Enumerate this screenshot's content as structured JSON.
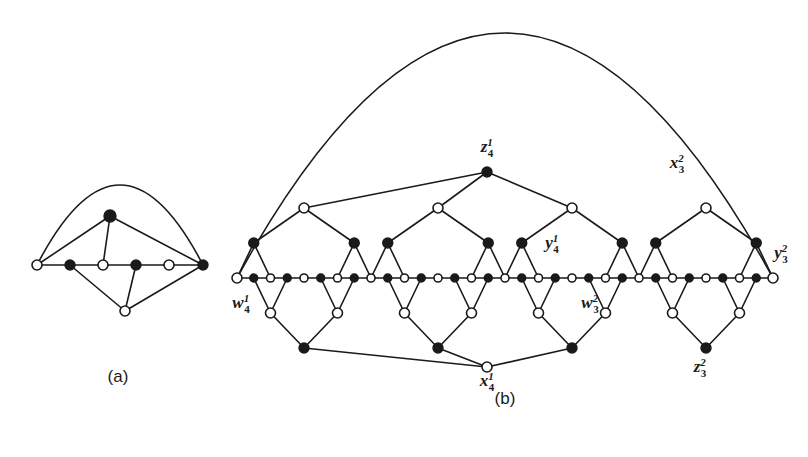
{
  "figure": {
    "background_color": "#ffffff",
    "ink_color": "#1a1a1a",
    "width": 808,
    "height": 457
  },
  "panels": [
    {
      "id": "panel-a",
      "caption": "(a)",
      "caption_x": 118,
      "caption_y": 382,
      "description": "Small graph: six-vertex path with an apex above and a vertex below, closed by an outer arc."
    },
    {
      "id": "panel-b",
      "caption": "(b)",
      "caption_x": 505,
      "caption_y": 404,
      "description": "Large periodic graph: alternating baseline path with four diamond blocks above and below, plus hub vertices and a large outer arc."
    }
  ],
  "labels": [
    {
      "name": "z-1-4",
      "base": "z",
      "sup": "1",
      "sub": "4",
      "x": 487,
      "y": 152,
      "anchor": "middle",
      "panel": "panel-b"
    },
    {
      "name": "x-2-3",
      "base": "x",
      "sup": "2",
      "sub": "3",
      "x": 677,
      "y": 168,
      "anchor": "middle",
      "panel": "panel-b"
    },
    {
      "name": "y-1-4",
      "base": "y",
      "sup": "1",
      "sub": "4",
      "x": 552,
      "y": 248,
      "anchor": "middle",
      "panel": "panel-b"
    },
    {
      "name": "y-2-3",
      "base": "y",
      "sup": "2",
      "sub": "3",
      "x": 781,
      "y": 258,
      "anchor": "middle",
      "panel": "panel-b"
    },
    {
      "name": "w-1-4",
      "base": "w",
      "sup": "1",
      "sub": "4",
      "x": 241,
      "y": 308,
      "anchor": "middle",
      "panel": "panel-b"
    },
    {
      "name": "w-2-3",
      "base": "w",
      "sup": "2",
      "sub": "3",
      "x": 590,
      "y": 308,
      "anchor": "middle",
      "panel": "panel-b"
    },
    {
      "name": "z-2-3",
      "base": "z",
      "sup": "2",
      "sub": "3",
      "x": 700,
      "y": 372,
      "anchor": "middle",
      "panel": "panel-b"
    },
    {
      "name": "x-1-4",
      "base": "x",
      "sup": "1",
      "sub": "4",
      "x": 487,
      "y": 386,
      "anchor": "middle",
      "panel": "panel-b"
    }
  ],
  "graph_a": {
    "baseline_y": 265,
    "nodes": [
      {
        "name": "a-b0",
        "x": 37,
        "y": 265,
        "type": "hollow",
        "r": 5
      },
      {
        "name": "a-b1",
        "x": 70,
        "y": 265,
        "type": "filled",
        "r": 5
      },
      {
        "name": "a-b2",
        "x": 103,
        "y": 265,
        "type": "hollow",
        "r": 5
      },
      {
        "name": "a-b3",
        "x": 136,
        "y": 265,
        "type": "filled",
        "r": 5
      },
      {
        "name": "a-b4",
        "x": 169,
        "y": 265,
        "type": "hollow",
        "r": 5
      },
      {
        "name": "a-b5",
        "x": 203,
        "y": 265,
        "type": "filled",
        "r": 5
      },
      {
        "name": "a-top",
        "x": 110,
        "y": 216,
        "type": "filled",
        "r": 6
      },
      {
        "name": "a-bottom",
        "x": 125,
        "y": 311,
        "type": "hollow",
        "r": 5
      }
    ],
    "edges": [
      {
        "name": "a-edge-b0-b1",
        "from": 0,
        "to": 1
      },
      {
        "name": "a-edge-b1-b2",
        "from": 1,
        "to": 2
      },
      {
        "name": "a-edge-b2-b3",
        "from": 2,
        "to": 3
      },
      {
        "name": "a-edge-b3-b4",
        "from": 3,
        "to": 4
      },
      {
        "name": "a-edge-b4-b5",
        "from": 4,
        "to": 5
      },
      {
        "name": "a-edge-b0-top",
        "from": 0,
        "to": 6
      },
      {
        "name": "a-edge-b2-top",
        "from": 2,
        "to": 6
      },
      {
        "name": "a-edge-b5-top",
        "from": 5,
        "to": 6
      },
      {
        "name": "a-edge-b1-bottom",
        "from": 1,
        "to": 7
      },
      {
        "name": "a-edge-b3-bottom",
        "from": 3,
        "to": 7
      },
      {
        "name": "a-edge-b5-bottom",
        "from": 5,
        "to": 7
      }
    ],
    "arcs": [
      {
        "name": "a-outer-arc",
        "from": 0,
        "to": 5,
        "apex_x": 120,
        "apex_y": 185
      }
    ]
  },
  "graph_b": {
    "baseline_y": 278,
    "baseline_x_start": 237,
    "baseline_x_end": 773,
    "baseline_count": 33,
    "baseline_start_type": "hollow",
    "blocks": 4,
    "block_span": 8,
    "upper_apex_y": 208,
    "upper_mid_y": 243,
    "lower_apex_y": 348,
    "lower_mid_y": 313,
    "hub_top": {
      "name": "z-1-4-node",
      "x": 487,
      "y": 172,
      "type": "filled",
      "r": 5
    },
    "hub_bottom": {
      "name": "x-1-4-node",
      "x": 487,
      "y": 367,
      "type": "hollow",
      "r": 5
    },
    "hub_top_connects_blocks": [
      0,
      1,
      2
    ],
    "hub_bottom_connects_blocks": [
      0,
      1,
      2
    ],
    "outer_arc": {
      "name": "b-outer-arc",
      "from_x": 237,
      "to_x": 773,
      "apex_x": 505,
      "apex_y": 33
    },
    "endpoint_left": {
      "name": "w-1-4-node",
      "type": "hollow"
    },
    "endpoint_right": {
      "name": "y-2-3-node",
      "type": "filled"
    }
  }
}
